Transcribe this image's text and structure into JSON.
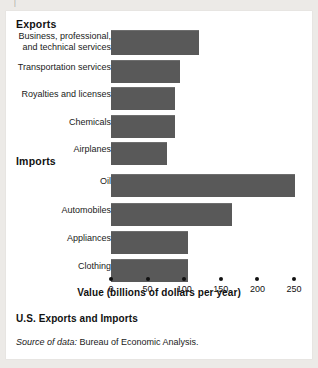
{
  "stray_glyph": "|",
  "chart_data": {
    "type": "bar",
    "orientation": "horizontal",
    "title": "U.S. Exports and Imports",
    "xlabel": "Value (billions of dollars per year)",
    "ylabel": "",
    "xlim": [
      0,
      260
    ],
    "grid": false,
    "legend": false,
    "bar_color": "#595959",
    "ticks": [
      {
        "value": 0,
        "label": "0"
      },
      {
        "value": 50,
        "label": "50"
      },
      {
        "value": 100,
        "label": "100"
      },
      {
        "value": 150,
        "label": "150"
      },
      {
        "value": 200,
        "label": "200"
      },
      {
        "value": 250,
        "label": "250"
      }
    ],
    "groups": [
      {
        "name": "Exports",
        "categories": [
          "Business, professional,\nand technical services",
          "Transportation services",
          "Royalties and licenses",
          "Chemicals",
          "Airplanes"
        ],
        "values": [
          120,
          94,
          87,
          87,
          77
        ]
      },
      {
        "name": "Imports",
        "categories": [
          "Oil",
          "Automobiles",
          "Appliances",
          "Clothing"
        ],
        "values": [
          251,
          165,
          105,
          105
        ]
      }
    ]
  },
  "caption": {
    "title": "U.S. Exports and Imports",
    "source_label": "Source of data:",
    "source_text": " Bureau of Economic Analysis."
  }
}
